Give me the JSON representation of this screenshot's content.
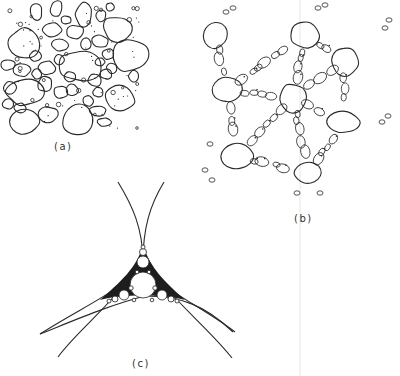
{
  "figure": {
    "line_color": "#2a2a2a",
    "background_color": "#ffffff",
    "panels": [
      {
        "id": "a",
        "label": "(a)",
        "content": "Dense random packing of large irregular rounded particles with smaller particles and fine dots filling the gaps"
      },
      {
        "id": "b",
        "label": "(b)",
        "content": "Network of large particles connected by chains of small elliptical particles"
      },
      {
        "id": "c",
        "label": "(c)",
        "content": "Curvilinear triangular gap between three large touching circles filled with an Apollonian-like packing of progressively smaller circles"
      }
    ]
  }
}
